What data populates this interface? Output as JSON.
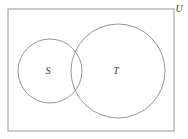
{
  "figure": {
    "kind": "venn-diagram",
    "background_color": "#ffffff",
    "stroke_color": "#8c8c8c",
    "label_color": "#3a3a3a"
  },
  "universe": {
    "label": "U",
    "shape": "rectangle",
    "x": 8,
    "y": 9,
    "width": 166,
    "height": 122,
    "label_x": 179,
    "label_y": 9
  },
  "sets": [
    {
      "label": "S",
      "shape": "circle",
      "cx": 50,
      "cy": 71,
      "r": 32,
      "label_x": 48,
      "label_y": 71
    },
    {
      "label": "T",
      "shape": "circle",
      "cx": 118,
      "cy": 71,
      "r": 47,
      "label_x": 116,
      "label_y": 71
    }
  ]
}
